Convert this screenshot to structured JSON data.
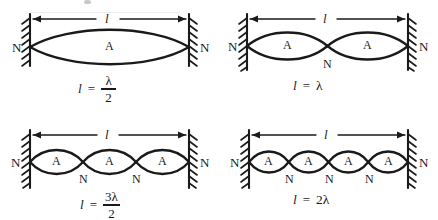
{
  "figure": {
    "ink_color": "#1a1a1a",
    "background_color": "#ffffff",
    "length_symbol": "l",
    "equals_sign": "=",
    "node_label": "N",
    "antinode_label": "A"
  },
  "panels": [
    {
      "id": "harmonic-1",
      "loops": 1,
      "dimension_label": "l",
      "wall_label_left": "N",
      "wall_label_right": "N",
      "antinode_labels": [
        "A"
      ],
      "interior_node_labels": [],
      "equation": {
        "lhs": "l",
        "operator": "=",
        "rhs_type": "fraction",
        "numerator": "λ",
        "denominator": "2",
        "text": "l = λ/2"
      }
    },
    {
      "id": "harmonic-2",
      "loops": 2,
      "dimension_label": "l",
      "wall_label_left": "N",
      "wall_label_right": "N",
      "antinode_labels": [
        "A",
        "A"
      ],
      "interior_node_labels": [
        "N"
      ],
      "equation": {
        "lhs": "l",
        "operator": "=",
        "rhs_type": "plain",
        "rhs": "λ",
        "text": "l = λ"
      }
    },
    {
      "id": "harmonic-3",
      "loops": 3,
      "dimension_label": "l",
      "wall_label_left": "N",
      "wall_label_right": "N",
      "antinode_labels": [
        "A",
        "A",
        "A"
      ],
      "interior_node_labels": [
        "N",
        "N"
      ],
      "equation": {
        "lhs": "l",
        "operator": "=",
        "rhs_type": "fraction",
        "numerator": "3λ",
        "denominator": "2",
        "text": "l = 3λ/2"
      }
    },
    {
      "id": "harmonic-4",
      "loops": 4,
      "dimension_label": "l",
      "wall_label_left": "N",
      "wall_label_right": "N",
      "antinode_labels": [
        "A",
        "A",
        "A",
        "A"
      ],
      "interior_node_labels": [
        "N",
        "N",
        "N"
      ],
      "equation": {
        "lhs": "l",
        "operator": "=",
        "rhs_type": "plain",
        "rhs": "2λ",
        "text": "l = 2λ"
      }
    }
  ]
}
